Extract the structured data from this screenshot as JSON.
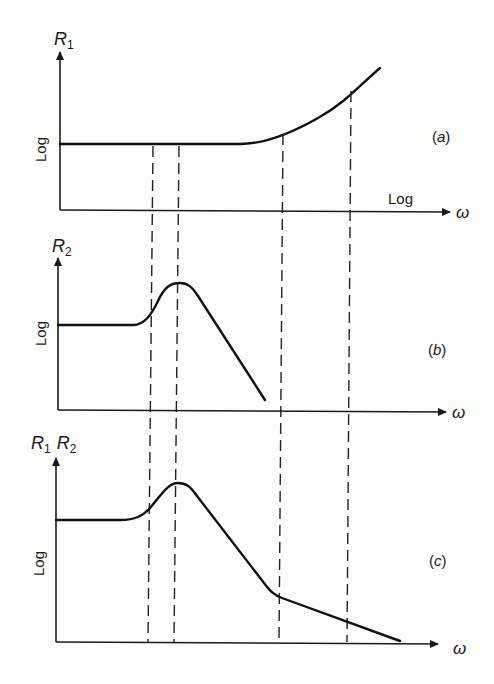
{
  "figure": {
    "panels": [
      {
        "id": "a",
        "tag": "(a)",
        "tag_letter": "a",
        "y_label_main": "R",
        "y_label_sub": "1",
        "y_scale_label": "Log",
        "x_scale_label": "Log",
        "x_label": "ω",
        "description": "R1 flat at low frequency, rising at high frequency"
      },
      {
        "id": "b",
        "tag": "(b)",
        "tag_letter": "b",
        "y_label_main": "R",
        "y_label_sub": "2",
        "y_scale_label": "Log",
        "x_label": "ω",
        "description": "R2 flat, resonance peak, then falling"
      },
      {
        "id": "c",
        "tag": "(c)",
        "tag_letter": "c",
        "y_label_main1": "R",
        "y_label_sub1": "1",
        "y_label_main2": "R",
        "y_label_sub2": "2",
        "y_scale_label": "Log",
        "x_label": "ω",
        "description": "Product R1R2: flat, peak, falling with reduced slope at high frequency"
      }
    ],
    "dashed_guides_count": 4
  }
}
